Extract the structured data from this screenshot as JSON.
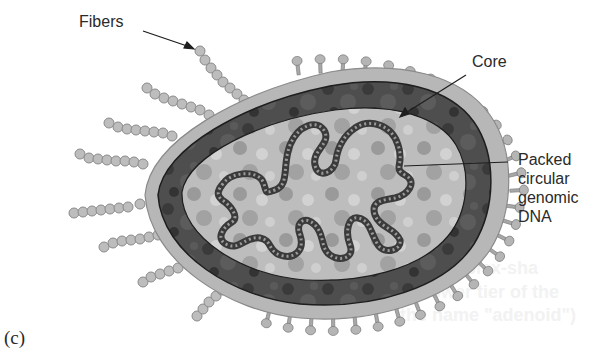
{
  "figure": {
    "panel_label": "(c)",
    "labels": {
      "fibers": "Fibers",
      "core": "Core",
      "dna_line1": "Packed",
      "dna_line2": "circular",
      "dna_line3": "genomic",
      "dna_line4": "DNA"
    },
    "bleed_through_text": [
      "complex-sha",
      "lower tier of the",
      "the name \"adenoid\")"
    ],
    "colors": {
      "outer_capsid": "#b3b3b3",
      "core_shell": "#4a4a4a",
      "inner": "#b9b9b9",
      "dna": "#5a5a5a",
      "fiber": "#b8b8b8",
      "text": "#2a2a2a"
    }
  }
}
